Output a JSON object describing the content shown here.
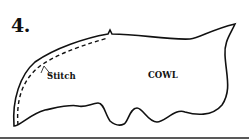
{
  "figure": {
    "step_number": "4.",
    "labels": {
      "stitch": "Stitch",
      "cowl": "COWL"
    },
    "colors": {
      "line": "#111111",
      "background": "#ffffff"
    }
  }
}
